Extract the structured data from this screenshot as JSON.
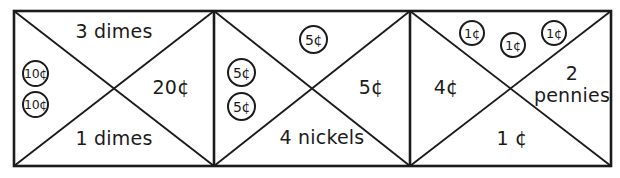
{
  "diagram": {
    "stroke_color": "#1b1b1b",
    "background_color": "#ffffff",
    "box_count": 3,
    "boxes": [
      {
        "name": "dimes-box",
        "top_label": "3 dimes",
        "bottom_label": "1 dimes",
        "right_label": "20¢",
        "left_coins": [
          {
            "label": "10¢",
            "type": "dime"
          },
          {
            "label": "10¢",
            "type": "dime"
          }
        ],
        "top_coins": []
      },
      {
        "name": "nickels-box",
        "top_label": "",
        "bottom_label": "4 nickels",
        "right_label": "5¢",
        "left_coins": [
          {
            "label": "5¢",
            "type": "nickel"
          },
          {
            "label": "5¢",
            "type": "nickel"
          }
        ],
        "top_coins": [
          {
            "label": "5¢",
            "type": "nickel"
          }
        ]
      },
      {
        "name": "pennies-box",
        "top_label": "",
        "bottom_label": "1 ¢",
        "left_label": "4¢",
        "right_label_line1": "2",
        "right_label_line2": "pennies",
        "left_coins": [],
        "top_coins": [
          {
            "label": "1¢",
            "type": "penny"
          },
          {
            "label": "1¢",
            "type": "penny"
          },
          {
            "label": "1¢",
            "type": "penny"
          }
        ]
      }
    ]
  }
}
